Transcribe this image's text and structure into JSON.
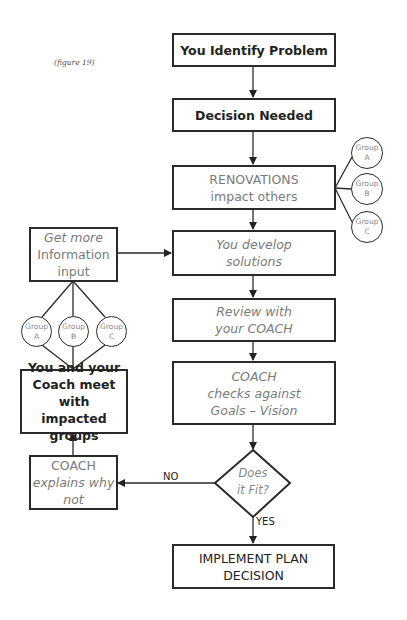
{
  "caption": "(figure 19)",
  "boxes": {
    "identify": {
      "lines": [
        "You Identify Problem"
      ]
    },
    "decision": {
      "lines": [
        "Decision Needed"
      ]
    },
    "renovations": {
      "lines": [
        "RENOVATIONS",
        "impact others"
      ]
    },
    "develop": {
      "lines": [
        "You develop",
        "solutions"
      ]
    },
    "review": {
      "lines": [
        "Review with",
        "your COACH"
      ]
    },
    "checks": {
      "lines": [
        "COACH",
        "checks against",
        "Goals – Vision"
      ]
    },
    "implement": {
      "lines": [
        "IMPLEMENT PLAN",
        "DECISION"
      ]
    },
    "get_info": {
      "lines": [
        "Get more",
        "Information",
        "input"
      ]
    },
    "meet": {
      "lines": [
        "You and your",
        "Coach meet with",
        "impacted groups"
      ]
    },
    "explains": {
      "lines": [
        "COACH",
        "explains why",
        "not"
      ]
    }
  },
  "decision_diamond": {
    "lines": [
      "Does",
      "it Fit?"
    ]
  },
  "edge_labels": {
    "no": "NO",
    "yes": "YES"
  },
  "groups_right": [
    {
      "word": "Group",
      "letter": "A"
    },
    {
      "word": "Group",
      "letter": "B"
    },
    {
      "word": "Group",
      "letter": "C"
    }
  ],
  "groups_left": [
    {
      "word": "Group",
      "letter": "A"
    },
    {
      "word": "Group",
      "letter": "B"
    },
    {
      "word": "Group",
      "letter": "C"
    }
  ]
}
